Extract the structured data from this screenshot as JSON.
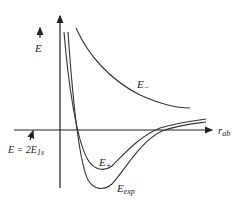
{
  "diagram": {
    "type": "potential-energy-curves",
    "y_axis": {
      "label": "E",
      "arrow": true
    },
    "x_axis": {
      "label_main": "r",
      "label_sub": "ab",
      "arrow": true
    },
    "reference_level": {
      "label_main": "E = 2E",
      "label_sub": "1s"
    },
    "curves": [
      {
        "name": "E_minus",
        "label_main": "E",
        "label_sub": "−",
        "description": "repulsive, antibonding"
      },
      {
        "name": "E_plus",
        "label_main": "E",
        "label_sub": "+",
        "description": "bonding, shallow well"
      },
      {
        "name": "E_exp",
        "label_main": "E",
        "label_sub": "exp",
        "description": "experimental, deeper well"
      }
    ],
    "colors": {
      "line": "#333333",
      "background": "#ffffff"
    }
  }
}
